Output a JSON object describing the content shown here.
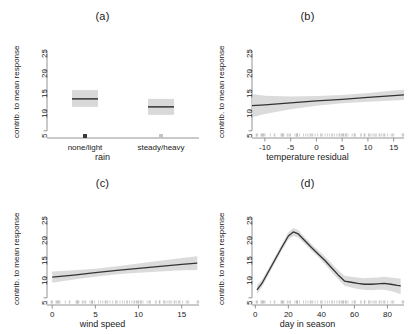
{
  "figure": {
    "background": "#ffffff",
    "band_color": "#d9d9d9",
    "line_color": "#333333",
    "axis_color": "#888888",
    "ylabel": "contrib. to mean response",
    "yticks": [
      5,
      10,
      15,
      20,
      25
    ],
    "ylim": [
      3.2,
      26.5
    ]
  },
  "chart_data": [
    {
      "type": "bar",
      "panel": "a",
      "title": "(a)",
      "xlabel": "rain",
      "ylabel": "contrib. to mean response",
      "categories": [
        "none/light",
        "steady/heavy"
      ],
      "values": [
        13.0,
        11.0
      ],
      "ci_low": [
        11.0,
        9.0
      ],
      "ci_high": [
        15.2,
        13.0
      ],
      "ylim": [
        3.2,
        26.5
      ],
      "yticks": [
        5,
        10,
        15,
        20,
        25
      ],
      "grid": false,
      "legend": "none",
      "note": "partial-effect boxes with median line and grey confidence band"
    },
    {
      "type": "line",
      "panel": "b",
      "title": "(b)",
      "xlabel": "temperature residual",
      "ylabel": "contrib. to mean response",
      "xticks": [
        -10,
        -5,
        0,
        5,
        10,
        15
      ],
      "yticks": [
        5,
        10,
        15,
        20,
        25
      ],
      "xlim": [
        -12.5,
        17.0
      ],
      "ylim": [
        3.2,
        26.5
      ],
      "x": [
        -12.5,
        -10,
        -5,
        0,
        5,
        10,
        15,
        17
      ],
      "values": [
        11.3,
        11.5,
        12.0,
        12.5,
        12.9,
        13.4,
        13.8,
        14.0
      ],
      "ci_low": [
        8.4,
        9.2,
        10.4,
        11.3,
        11.9,
        12.3,
        12.6,
        12.7
      ],
      "ci_high": [
        14.2,
        13.8,
        13.6,
        13.7,
        14.0,
        14.5,
        15.1,
        15.3
      ],
      "grid": false,
      "legend": "none",
      "rug": true
    },
    {
      "type": "line",
      "panel": "c",
      "title": "(c)",
      "xlabel": "wind speed",
      "ylabel": "contrib. to mean response",
      "xticks": [
        0,
        5,
        10,
        15
      ],
      "yticks": [
        5,
        10,
        15,
        20,
        25
      ],
      "xlim": [
        -0.6,
        17.0
      ],
      "ylim": [
        3.2,
        26.5
      ],
      "x": [
        0,
        2.5,
        5,
        7.5,
        10,
        12.5,
        15,
        16.8
      ],
      "values": [
        10.2,
        10.7,
        11.3,
        11.9,
        12.4,
        12.9,
        13.4,
        13.7
      ],
      "ci_low": [
        8.8,
        9.6,
        10.3,
        10.9,
        11.3,
        11.6,
        11.9,
        12.0
      ],
      "ci_high": [
        11.6,
        11.9,
        12.3,
        12.9,
        13.6,
        14.3,
        15.0,
        15.4
      ],
      "grid": false,
      "legend": "none",
      "rug": true
    },
    {
      "type": "line",
      "panel": "d",
      "title": "(d)",
      "xlabel": "day in season",
      "ylabel": "contrib. to mean response",
      "xticks": [
        0,
        20,
        40,
        60,
        80
      ],
      "yticks": [
        5,
        10,
        15,
        20,
        25
      ],
      "xlim": [
        -2,
        90
      ],
      "ylim": [
        3.2,
        26.5
      ],
      "x": [
        1,
        4,
        8,
        12,
        16,
        20,
        23,
        26,
        30,
        34,
        38,
        42,
        46,
        50,
        54,
        58,
        62,
        66,
        70,
        74,
        78,
        82,
        86,
        88
      ],
      "values": [
        7.0,
        8.6,
        11.6,
        14.6,
        17.6,
        20.5,
        21.5,
        21.0,
        19.3,
        17.6,
        16.0,
        14.4,
        12.6,
        10.8,
        9.2,
        8.9,
        8.6,
        8.4,
        8.4,
        8.5,
        8.6,
        8.4,
        8.1,
        8.0
      ],
      "ci_low": [
        5.9,
        7.7,
        10.8,
        13.8,
        16.8,
        19.6,
        20.5,
        20.1,
        18.5,
        16.8,
        15.2,
        13.5,
        11.6,
        9.7,
        8.0,
        7.6,
        7.2,
        7.0,
        6.9,
        7.0,
        7.0,
        6.7,
        6.2,
        5.9
      ],
      "ci_high": [
        8.1,
        9.5,
        12.4,
        15.4,
        18.4,
        21.4,
        22.5,
        22.0,
        20.2,
        18.5,
        16.9,
        15.4,
        13.7,
        12.0,
        10.5,
        10.3,
        10.1,
        9.9,
        10.0,
        10.1,
        10.3,
        10.1,
        9.9,
        9.8
      ],
      "grid": false,
      "legend": "none",
      "rug": true
    }
  ]
}
